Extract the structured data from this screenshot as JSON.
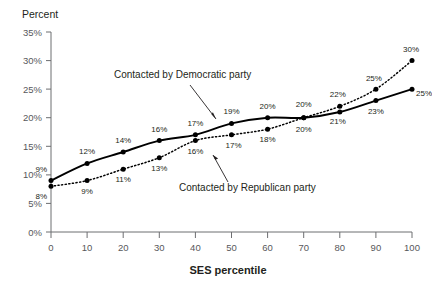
{
  "chart_data": {
    "type": "line",
    "title": "",
    "ylabel": "Percent",
    "xlabel": "SES percentile",
    "x": [
      0,
      10,
      20,
      30,
      40,
      50,
      60,
      70,
      80,
      90,
      100
    ],
    "xlim": [
      0,
      100
    ],
    "ylim": [
      0,
      35
    ],
    "xticks": [
      "0",
      "10",
      "20",
      "30",
      "40",
      "50",
      "60",
      "70",
      "80",
      "90",
      "100"
    ],
    "yticks": [
      "0%",
      "5%",
      "10%",
      "15%",
      "20%",
      "25%",
      "30%",
      "35%"
    ],
    "grid": false,
    "legend_position": "inline-annotations",
    "series": [
      {
        "name": "Contacted by Democratic party",
        "style": "solid",
        "values": [
          9,
          12,
          14,
          16,
          17,
          19,
          20,
          20,
          21,
          23,
          25
        ],
        "labels": [
          "9%",
          "12%",
          "14%",
          "16%",
          "17%",
          "19%",
          "20%",
          "20%",
          "21%",
          "23%",
          "25%"
        ]
      },
      {
        "name": "Contacted by Republican party",
        "style": "dotted",
        "values": [
          8,
          9,
          11,
          13,
          16,
          17,
          18,
          20,
          22,
          25,
          30
        ],
        "labels": [
          "8%",
          "9%",
          "11%",
          "13%",
          "16%",
          "17%",
          "18%",
          "20%",
          "22%",
          "25%",
          "30%"
        ]
      }
    ],
    "annotations": [
      {
        "text": "Contacted by Democratic party",
        "target_series": "Contacted by Democratic party"
      },
      {
        "text": "Contacted by Republican party",
        "target_series": "Contacted by Republican party"
      }
    ]
  },
  "colors": {
    "background": "#ffffff",
    "line": "#000000",
    "axis": "#6d6e71",
    "text": "#231f20",
    "tick_text": "#58585b"
  }
}
